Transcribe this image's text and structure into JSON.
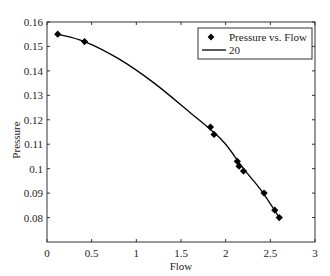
{
  "chart_data": {
    "type": "scatter",
    "title": "",
    "xlabel": "Flow",
    "ylabel": "Pressure",
    "xlim": [
      0,
      3
    ],
    "ylim": [
      0.07,
      0.16
    ],
    "x_ticks": [
      0,
      0.5,
      1,
      1.5,
      2,
      2.5,
      3
    ],
    "x_tick_labels": [
      "0",
      "0.5",
      "1",
      "1.5",
      "2",
      "2.5",
      "3"
    ],
    "y_ticks": [
      0.08,
      0.09,
      0.1,
      0.11,
      0.12,
      0.13,
      0.14,
      0.15,
      0.16
    ],
    "y_tick_labels": [
      "0.08",
      "0.09",
      "0.1",
      "0.11",
      "0.12",
      "0.13",
      "0.14",
      "0.15",
      "0.16"
    ],
    "grid": false,
    "legend_position": "upper right",
    "series": [
      {
        "name": "Pressure vs. Flow",
        "kind": "scatter",
        "marker": "diamond",
        "x": [
          0.12,
          0.42,
          1.83,
          1.87,
          2.13,
          2.15,
          2.2,
          2.43,
          2.55,
          2.6
        ],
        "y": [
          0.155,
          0.152,
          0.117,
          0.114,
          0.103,
          0.101,
          0.099,
          0.09,
          0.083,
          0.08
        ]
      },
      {
        "name": "20",
        "kind": "line",
        "x": [
          0.12,
          0.42,
          0.8,
          1.2,
          1.6,
          1.83,
          2.0,
          2.2,
          2.4,
          2.6
        ],
        "y": [
          0.155,
          0.152,
          0.145,
          0.135,
          0.123,
          0.116,
          0.11,
          0.1,
          0.091,
          0.08
        ]
      }
    ],
    "colors": {
      "marker": "#000000",
      "line": "#000000",
      "axes": "#333333"
    }
  }
}
